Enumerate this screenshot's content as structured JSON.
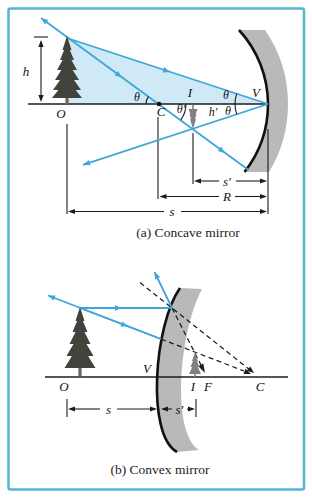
{
  "colors": {
    "border": "#56b6cf",
    "ray": "#3ea6d8",
    "shade": "#cfe9f6",
    "mirror": "#b9b9b9",
    "line": "#1c1c1c",
    "tree": "#40443c",
    "trunk": "#6e665a",
    "image_tree": "#808080"
  },
  "panel_a": {
    "caption": "(a)  Concave mirror",
    "labels": {
      "object_height": "h",
      "object_point": "O",
      "angle_at_C": "θ",
      "angle_at_C_reflected": "θ′",
      "center_of_curvature": "C",
      "image_point": "I",
      "image_height": "h′",
      "angle_at_V_incident": "θ",
      "angle_at_V_reflected": "θ",
      "vertex": "V",
      "image_distance": "s′",
      "radius_of_curvature": "R",
      "object_distance": "s"
    }
  },
  "panel_b": {
    "caption": "(b)  Convex mirror",
    "labels": {
      "object_point": "O",
      "vertex": "V",
      "image_point": "I",
      "focal_point": "F",
      "center_of_curvature": "C",
      "object_distance": "s",
      "image_distance": "s′"
    }
  }
}
